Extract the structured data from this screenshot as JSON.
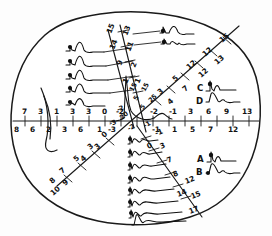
{
  "figure": {
    "shape": "oval-outline",
    "ink_color": "#111111",
    "background_color": "#ffffff"
  },
  "panel_labels": [
    {
      "id": "A",
      "text": "A"
    },
    {
      "id": "B",
      "text": "B"
    },
    {
      "id": "C",
      "text": "C"
    },
    {
      "id": "D",
      "text": "D"
    }
  ],
  "axes": {
    "horizontal": {
      "name": "horizontal-axis",
      "upper_ticks": [
        "7",
        "3",
        "1",
        "3",
        "3",
        "0",
        "-2",
        "-2",
        "-1",
        "3",
        "6",
        "9",
        "13"
      ],
      "lower_ticks": [
        "8",
        "6",
        "2",
        "3",
        "6",
        "1",
        "-3",
        "-1",
        "1",
        "5",
        "7",
        "12"
      ]
    },
    "upper_right_diagonal": {
      "name": "upper-right-diagonal-axis",
      "upper_ticks": [
        "3",
        "5",
        "12",
        "12",
        "15"
      ],
      "lower_ticks": [
        "4",
        "7",
        "12",
        "13"
      ]
    },
    "upper_left_diagonal": {
      "name": "upper-left-diagonal-axis",
      "upper_ticks": [
        "15",
        "14",
        "9",
        "1"
      ],
      "lower_ticks": [
        "13",
        "11",
        "2",
        "1"
      ]
    },
    "lower_left_diagonal": {
      "name": "lower-left-diagonal-axis",
      "upper_ticks": [
        "0",
        "3",
        "5",
        "7",
        "8"
      ],
      "lower_ticks": [
        "3",
        "4",
        "9",
        "10"
      ]
    },
    "lower_right_diagonal": {
      "name": "lower-right-diagonal-axis",
      "ticks": [
        "-1",
        "0",
        "3",
        "7",
        "8",
        "12",
        "14",
        "15",
        "17"
      ]
    },
    "center_cluster": {
      "name": "center-tick-cluster",
      "values": [
        "15",
        "15",
        "25",
        "5",
        "5",
        "20",
        "-2",
        "-3",
        "-2",
        "-1"
      ]
    }
  },
  "traces": {
    "left_group_count": 5,
    "top_group_count": 2,
    "bottom_group_count": 8,
    "right_upper_group_count": 2,
    "right_lower_group_count": 2
  }
}
